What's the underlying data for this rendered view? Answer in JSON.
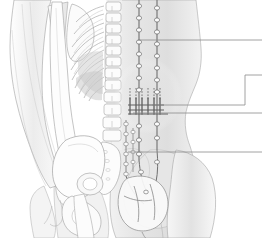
{
  "figure": {
    "view": "posterior",
    "background_color": "#ffffff",
    "width": 262,
    "height": 238,
    "outline_color": "#9a9a9a",
    "shading_color": "#d8d8d8",
    "nerve_color": "#6f6f6f",
    "leader_color": "#8c8c8c"
  },
  "body": {
    "torso_label": "torso-outline",
    "left_arm_label": "left-arm-outline",
    "right_arm_label": "right-arm-outline",
    "buttock_label": "gluteal-outline",
    "thigh_label": "thigh-outline"
  },
  "skeleton": {
    "parts": [
      {
        "name": "humerus",
        "label": "Humerus"
      },
      {
        "name": "radius",
        "label": "Radius"
      },
      {
        "name": "ulna",
        "label": "Ulna"
      },
      {
        "name": "scapula",
        "label": "Scapula"
      },
      {
        "name": "ribs",
        "label": "Ribs"
      },
      {
        "name": "thoracic-vertebrae",
        "label": "Thoracic vertebrae"
      },
      {
        "name": "lumbar-vertebrae",
        "label": "Lumbar vertebrae"
      },
      {
        "name": "sacrum",
        "label": "Sacrum"
      },
      {
        "name": "ilium",
        "label": "Ilium"
      },
      {
        "name": "pubis",
        "label": "Pubis"
      },
      {
        "name": "femur",
        "label": "Femur"
      }
    ]
  },
  "nerves": {
    "trunks": [
      {
        "name": "left-sympathetic-trunk",
        "x": 139,
        "ganglion_count": 14
      },
      {
        "name": "right-sympathetic-trunk",
        "x": 157,
        "ganglion_count": 14
      }
    ],
    "splanchnic_rows": 5,
    "plexus_name": "abdominal-aortic-plexus",
    "bladder_name": "urinary-bladder"
  },
  "leaders": [
    {
      "id": 1,
      "label": "",
      "y": 40,
      "x_start": 138,
      "x_end": 262,
      "shape": "straight"
    },
    {
      "id": 2,
      "label": "",
      "y": 105,
      "x_start": 152,
      "x_end": 245,
      "shape": "elbow-down",
      "elbow_y": 75
    },
    {
      "id": 3,
      "label": "",
      "y": 113,
      "x_start": 133,
      "x_end": 262,
      "shape": "straight"
    },
    {
      "id": 4,
      "label": "",
      "y": 152,
      "x_start": 128,
      "x_end": 262,
      "shape": "straight"
    }
  ]
}
